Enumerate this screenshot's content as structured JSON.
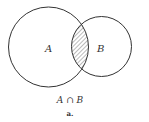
{
  "diagram": {
    "type": "venn",
    "sets": [
      {
        "label": "A",
        "cx": 48.5,
        "cy": 47,
        "r": 40
      },
      {
        "label": "B",
        "cx": 101.5,
        "cy": 46.5,
        "r": 30
      }
    ],
    "shaded_region": "intersection",
    "expression": "A ∩ B",
    "caption": "a."
  },
  "colors": {
    "stroke": "#333333",
    "hatch": "#555555",
    "background": "#ffffff"
  }
}
